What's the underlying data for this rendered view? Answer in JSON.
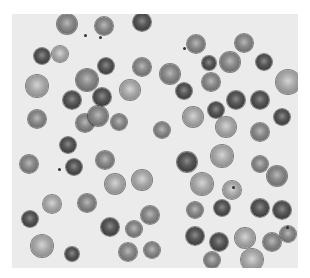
{
  "image": {
    "subject": "blood smear micrograph (red blood cells)",
    "colors": {
      "background": "#ffffff",
      "plasma": "#ebebeb",
      "cell_dark": "#3a3a3a",
      "cell_light": "#a8a8a8"
    }
  },
  "cells": [
    {
      "x": 55,
      "y": 10,
      "r": 10,
      "t": "mid"
    },
    {
      "x": 92,
      "y": 12,
      "r": 9,
      "t": "mid"
    },
    {
      "x": 130,
      "y": 8,
      "r": 9,
      "t": "dark"
    },
    {
      "x": 30,
      "y": 42,
      "r": 8,
      "t": "dark"
    },
    {
      "x": 48,
      "y": 40,
      "r": 8,
      "t": "light"
    },
    {
      "x": 94,
      "y": 52,
      "r": 8,
      "t": "dark"
    },
    {
      "x": 130,
      "y": 53,
      "r": 9,
      "t": "mid"
    },
    {
      "x": 25,
      "y": 72,
      "r": 11,
      "t": "light"
    },
    {
      "x": 75,
      "y": 66,
      "r": 11,
      "t": "mid"
    },
    {
      "x": 60,
      "y": 86,
      "r": 9,
      "t": "dark"
    },
    {
      "x": 90,
      "y": 83,
      "r": 9,
      "t": "dark"
    },
    {
      "x": 118,
      "y": 76,
      "r": 10,
      "t": "light"
    },
    {
      "x": 25,
      "y": 105,
      "r": 9,
      "t": "mid"
    },
    {
      "x": 73,
      "y": 109,
      "r": 9,
      "t": "mid"
    },
    {
      "x": 86,
      "y": 102,
      "r": 10,
      "t": "mid"
    },
    {
      "x": 107,
      "y": 108,
      "r": 8,
      "t": "mid"
    },
    {
      "x": 150,
      "y": 116,
      "r": 8,
      "t": "mid"
    },
    {
      "x": 184,
      "y": 30,
      "r": 9,
      "t": "mid"
    },
    {
      "x": 232,
      "y": 29,
      "r": 9,
      "t": "mid"
    },
    {
      "x": 252,
      "y": 48,
      "r": 8,
      "t": "dark"
    },
    {
      "x": 218,
      "y": 48,
      "r": 10,
      "t": "mid"
    },
    {
      "x": 197,
      "y": 49,
      "r": 7,
      "t": "dark"
    },
    {
      "x": 158,
      "y": 60,
      "r": 10,
      "t": "mid"
    },
    {
      "x": 172,
      "y": 77,
      "r": 8,
      "t": "dark"
    },
    {
      "x": 199,
      "y": 68,
      "r": 9,
      "t": "mid"
    },
    {
      "x": 224,
      "y": 86,
      "r": 9,
      "t": "dark"
    },
    {
      "x": 248,
      "y": 86,
      "r": 9,
      "t": "dark"
    },
    {
      "x": 276,
      "y": 68,
      "r": 12,
      "t": "light"
    },
    {
      "x": 181,
      "y": 103,
      "r": 10,
      "t": "light"
    },
    {
      "x": 204,
      "y": 96,
      "r": 8,
      "t": "dark"
    },
    {
      "x": 270,
      "y": 103,
      "r": 8,
      "t": "dark"
    },
    {
      "x": 248,
      "y": 118,
      "r": 9,
      "t": "mid"
    },
    {
      "x": 214,
      "y": 113,
      "r": 10,
      "t": "light"
    },
    {
      "x": 17,
      "y": 150,
      "r": 9,
      "t": "mid"
    },
    {
      "x": 56,
      "y": 131,
      "r": 8,
      "t": "dark"
    },
    {
      "x": 62,
      "y": 153,
      "r": 8,
      "t": "dark"
    },
    {
      "x": 93,
      "y": 146,
      "r": 9,
      "t": "mid"
    },
    {
      "x": 103,
      "y": 170,
      "r": 10,
      "t": "light"
    },
    {
      "x": 130,
      "y": 166,
      "r": 10,
      "t": "light"
    },
    {
      "x": 40,
      "y": 190,
      "r": 9,
      "t": "light"
    },
    {
      "x": 18,
      "y": 205,
      "r": 8,
      "t": "dark"
    },
    {
      "x": 75,
      "y": 189,
      "r": 9,
      "t": "mid"
    },
    {
      "x": 98,
      "y": 213,
      "r": 9,
      "t": "dark"
    },
    {
      "x": 122,
      "y": 215,
      "r": 8,
      "t": "mid"
    },
    {
      "x": 138,
      "y": 201,
      "r": 9,
      "t": "mid"
    },
    {
      "x": 30,
      "y": 232,
      "r": 11,
      "t": "light"
    },
    {
      "x": 60,
      "y": 240,
      "r": 7,
      "t": "dark"
    },
    {
      "x": 116,
      "y": 238,
      "r": 9,
      "t": "mid"
    },
    {
      "x": 140,
      "y": 236,
      "r": 8,
      "t": "mid"
    },
    {
      "x": 175,
      "y": 148,
      "r": 10,
      "t": "dark"
    },
    {
      "x": 210,
      "y": 142,
      "r": 11,
      "t": "light"
    },
    {
      "x": 248,
      "y": 150,
      "r": 8,
      "t": "mid"
    },
    {
      "x": 190,
      "y": 170,
      "r": 11,
      "t": "light"
    },
    {
      "x": 220,
      "y": 176,
      "r": 9,
      "t": "light"
    },
    {
      "x": 265,
      "y": 162,
      "r": 10,
      "t": "mid"
    },
    {
      "x": 183,
      "y": 196,
      "r": 8,
      "t": "mid"
    },
    {
      "x": 210,
      "y": 194,
      "r": 8,
      "t": "dark"
    },
    {
      "x": 248,
      "y": 194,
      "r": 9,
      "t": "dark"
    },
    {
      "x": 270,
      "y": 196,
      "r": 9,
      "t": "dark"
    },
    {
      "x": 183,
      "y": 222,
      "r": 9,
      "t": "dark"
    },
    {
      "x": 207,
      "y": 228,
      "r": 9,
      "t": "dark"
    },
    {
      "x": 233,
      "y": 224,
      "r": 10,
      "t": "light"
    },
    {
      "x": 260,
      "y": 228,
      "r": 9,
      "t": "mid"
    },
    {
      "x": 200,
      "y": 246,
      "r": 8,
      "t": "mid"
    },
    {
      "x": 240,
      "y": 246,
      "r": 11,
      "t": "light"
    },
    {
      "x": 276,
      "y": 220,
      "r": 8,
      "t": "mid"
    }
  ],
  "dots": [
    {
      "x": 72,
      "y": 20
    },
    {
      "x": 87,
      "y": 22
    },
    {
      "x": 171,
      "y": 33
    },
    {
      "x": 46,
      "y": 154
    },
    {
      "x": 220,
      "y": 172
    },
    {
      "x": 274,
      "y": 212
    }
  ]
}
